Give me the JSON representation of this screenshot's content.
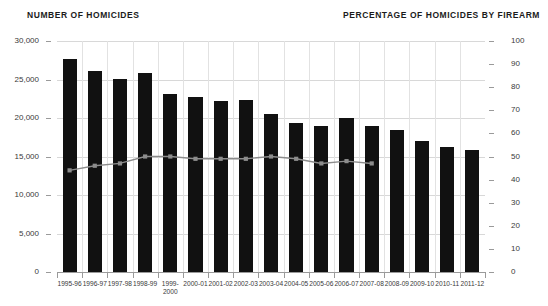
{
  "header": {
    "left_axis_title": "NUMBER OF HOMICIDES",
    "right_axis_title": "PERCENTAGE OF HOMICIDES BY FIREARM"
  },
  "colors": {
    "bar": "#111111",
    "line": "#8c8c8c",
    "grid": "#d8d8d8",
    "axis": "#9a9a9a",
    "text": "#3a3a3a",
    "title": "#1b1b1b"
  },
  "chart_data": {
    "type": "bar",
    "title": "",
    "xlabel": "",
    "ylabel": "NUMBER OF HOMICIDES",
    "y2label": "PERCENTAGE OF HOMICIDES BY FIREARM",
    "grid": true,
    "legend": "none",
    "ylim": [
      0,
      30000
    ],
    "y2lim": [
      0,
      100
    ],
    "yticks": [
      0,
      5000,
      10000,
      15000,
      20000,
      25000,
      30000
    ],
    "ytick_labels": [
      "0",
      "5,000",
      "10,000",
      "15,000",
      "20,000",
      "25,000",
      "30,000"
    ],
    "y2ticks": [
      0,
      10,
      20,
      30,
      40,
      50,
      60,
      70,
      80,
      90,
      100
    ],
    "y2tick_labels": [
      "0",
      "10",
      "20",
      "30",
      "40",
      "50",
      "60",
      "70",
      "80",
      "90",
      "100"
    ],
    "categories": [
      "1995-96",
      "1996-97",
      "1997-98",
      "1998-99",
      "1999-\n2000",
      "2000-01",
      "2001-02",
      "2002-03",
      "2003-04",
      "2004-05",
      "2005-06",
      "2006-07",
      "2007-08",
      "2008-09",
      "2009-10",
      "2010-11",
      "2011-12"
    ],
    "series": [
      {
        "name": "Number of homicides",
        "type": "bar",
        "axis": "left",
        "values": [
          27600,
          26100,
          25100,
          25800,
          23100,
          22700,
          22200,
          22300,
          20500,
          19400,
          19000,
          20000,
          18900,
          18400,
          17000,
          16300,
          15900
        ]
      },
      {
        "name": "Percentage of homicides by firearm",
        "type": "line",
        "axis": "right",
        "values": [
          44,
          46,
          47,
          50,
          50,
          49,
          49,
          49,
          50,
          49,
          47,
          48,
          47,
          null,
          null,
          null,
          null
        ]
      }
    ]
  }
}
